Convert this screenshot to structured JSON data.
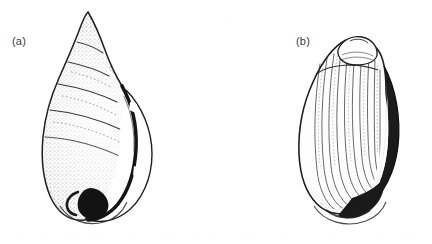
{
  "figure": {
    "type": "scientific-illustration",
    "medium": "stippled pen-and-ink line drawing, scanned",
    "background_color": "#ffffff",
    "ink_color": "#2b2b2b",
    "width_px": 432,
    "height_px": 244,
    "panel_count": 2,
    "caption": ""
  },
  "panels": [
    {
      "id": "a",
      "label": "(a)",
      "label_position": {
        "x": 12,
        "y": 35
      },
      "subject": "gastropod shell, apertural view",
      "description": "Elongate ovate-conical shell with pointed apex uppermost; several convex whorls separated by impressed spiral sutures; large inflated body whorl; narrow elongate aperture on the right side bounded by a dark thickened columellar lip that broadens into a dark callus at the base.",
      "orientation": "apex up, aperture facing right",
      "shading": "dense stipple over whorl surfaces, darkest along the columella and basal callus",
      "features": [
        "pointed apex",
        "spiral sutures",
        "body whorl",
        "aperture",
        "columella",
        "basal callus"
      ]
    },
    {
      "id": "b",
      "label": "(b)",
      "label_position": {
        "x": 296,
        "y": 35
      },
      "subject": "gastropod shell, dorsal / abapertural view",
      "description": "Broadly ovate shell with a small blunt rounded apex at the top; the swollen body whorl dominates and is covered with fine curved axial growth striae running from the shoulder to the base; a dark narrow crescent along the right margin marks the turned-back outer lip, and a dark patch at the lower right marks the siphonal region.",
      "orientation": "apex up, dorsum facing viewer",
      "shading": "fine axial striations with stippled margins; dark crescent on right edge and dark basal patch",
      "features": [
        "blunt apex",
        "shoulder",
        "axial growth striae",
        "outer lip crescent",
        "siphonal patch"
      ]
    }
  ],
  "colors": {
    "background": "#ffffff",
    "ink": "#2b2b2b",
    "label_text": "#3a3a3a",
    "deep_shadow": "#111111",
    "light_stipple": "#9a9a9a"
  }
}
